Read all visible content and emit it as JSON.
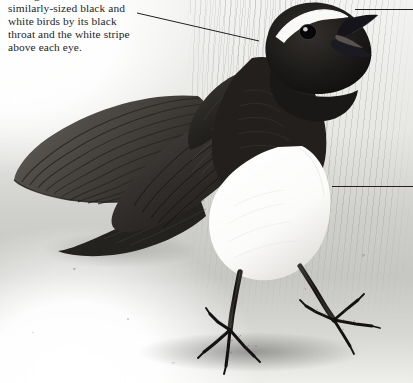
{
  "page": {
    "kind": "field-guide-illustration-plate",
    "width": 413,
    "height": 383
  },
  "caption": {
    "lines": [
      "distinguished from other",
      "similarly-sized black and",
      "white birds by its black",
      "throat and the white stripe",
      "above each eye."
    ],
    "line_0_clipped_at_top": true,
    "text_color": "#211f1e"
  },
  "leaders": [
    {
      "name": "leader-to-throat",
      "kind": "diagonal",
      "from": [
        137,
        13
      ],
      "to": [
        259,
        41
      ]
    },
    {
      "name": "leader-to-bill",
      "kind": "horizontal",
      "from": [
        355,
        9
      ],
      "to": [
        413,
        9
      ]
    },
    {
      "name": "leader-to-breast",
      "kind": "horizontal",
      "from": [
        332,
        186
      ],
      "to": [
        413,
        186
      ]
    }
  ],
  "illustration": {
    "alt": "Willie wagtail with fanned tail, black head and throat, white eyebrow stripe, white breast, standing on gravel ground",
    "parts": [
      "fanned-tail",
      "folded-wing",
      "back",
      "black-head",
      "white-eyebrow-stripe",
      "open-bill",
      "eye",
      "black-throat",
      "white-breast",
      "left-leg",
      "right-leg",
      "left-foot",
      "right-foot"
    ],
    "colors": {
      "plumage_black": "#191817",
      "plumage_dark_grey": "#3c3a37",
      "plumage_mid_grey": "#5b5855",
      "breast_white": "#ffffff",
      "eyebrow_white": "#f7f7f5",
      "ground_grey": "#c9c9c5",
      "paper_white": "#fdfdfc"
    }
  }
}
